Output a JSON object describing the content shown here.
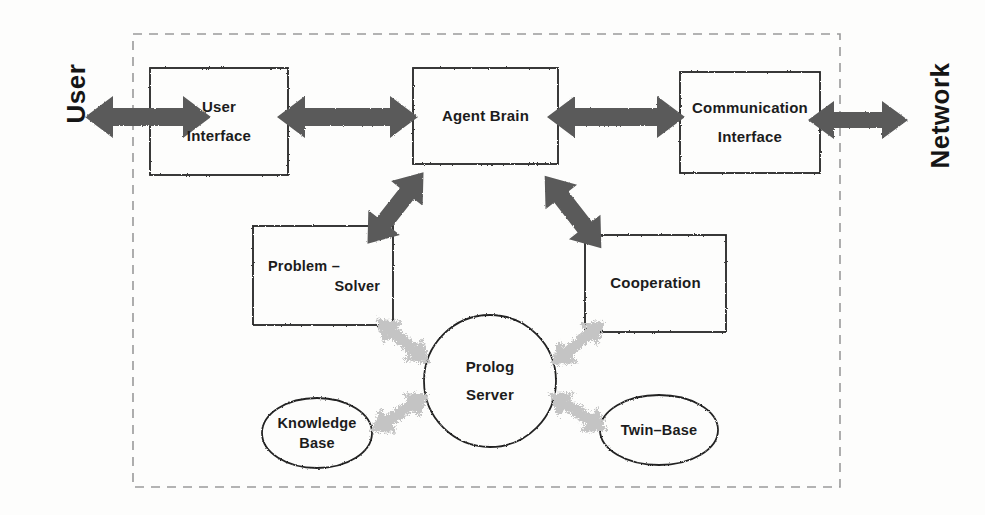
{
  "diagram": {
    "frame": {
      "name": "agent-boundary",
      "style": "dashed",
      "color": "#8f8f8f"
    },
    "external_actors": [
      {
        "id": "user",
        "label": "User",
        "side": "left"
      },
      {
        "id": "network",
        "label": "Network",
        "side": "right"
      }
    ],
    "boxes": [
      {
        "id": "user-interface",
        "line1": "User",
        "line2": "Interface"
      },
      {
        "id": "agent-brain",
        "line1": "Agent Brain",
        "line2": ""
      },
      {
        "id": "communication-interface",
        "line1": "Communication",
        "line2": "Interface"
      },
      {
        "id": "problem-solver",
        "line1": "Problem –",
        "line2": "Solver"
      },
      {
        "id": "cooperation",
        "line1": "Cooperation",
        "line2": ""
      }
    ],
    "ellipses": [
      {
        "id": "prolog-server",
        "line1": "Prolog",
        "line2": "Server",
        "shape": "circle"
      },
      {
        "id": "knowledge-base",
        "line1": "Knowledge",
        "line2": "Base",
        "shape": "ellipse"
      },
      {
        "id": "twin-base",
        "line1": "Twin–Base",
        "line2": "",
        "shape": "ellipse"
      }
    ],
    "connectors": [
      {
        "id": "user-to-ui",
        "from": "user",
        "to": "user-interface",
        "kind": "solid-bidirectional",
        "orientation": "horizontal"
      },
      {
        "id": "ui-to-brain",
        "from": "user-interface",
        "to": "agent-brain",
        "kind": "solid-bidirectional",
        "orientation": "horizontal"
      },
      {
        "id": "brain-to-comm",
        "from": "agent-brain",
        "to": "communication-interface",
        "kind": "solid-bidirectional",
        "orientation": "horizontal"
      },
      {
        "id": "comm-to-network",
        "from": "communication-interface",
        "to": "network",
        "kind": "solid-bidirectional",
        "orientation": "horizontal"
      },
      {
        "id": "brain-to-solver",
        "from": "agent-brain",
        "to": "problem-solver",
        "kind": "solid-bidirectional",
        "orientation": "diagonal"
      },
      {
        "id": "brain-to-cooperation",
        "from": "agent-brain",
        "to": "cooperation",
        "kind": "solid-bidirectional",
        "orientation": "diagonal"
      },
      {
        "id": "solver-to-prolog",
        "from": "problem-solver",
        "to": "prolog-server",
        "kind": "speckled-bidirectional",
        "orientation": "diagonal"
      },
      {
        "id": "cooperation-to-prolog",
        "from": "cooperation",
        "to": "prolog-server",
        "kind": "speckled-bidirectional",
        "orientation": "diagonal"
      },
      {
        "id": "knowledge-to-prolog",
        "from": "knowledge-base",
        "to": "prolog-server",
        "kind": "speckled-bidirectional",
        "orientation": "diagonal"
      },
      {
        "id": "twin-to-prolog",
        "from": "twin-base",
        "to": "prolog-server",
        "kind": "speckled-bidirectional",
        "orientation": "diagonal"
      }
    ],
    "colors": {
      "arrow_solid": "#575757",
      "arrow_speckled": "#c9c9c9",
      "stroke": "#1f1f1f",
      "frame": "#9a9a9a",
      "text": "#161616",
      "background": "#fdfdfc"
    }
  }
}
